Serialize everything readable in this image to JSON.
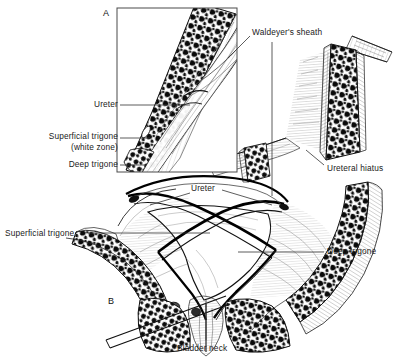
{
  "figure": {
    "style": "pen-and-ink anatomical line drawing, black and white",
    "panels": [
      {
        "id": "A",
        "mark": "A",
        "caption": "Longitudinal section of intramural ureter (inset box)"
      },
      {
        "id": "B",
        "mark": "B",
        "caption": "Interior view of bladder base and trigone"
      }
    ]
  },
  "labels": {
    "waldeyers_sheath": "Waldeyer's sheath",
    "ureter_a": "Ureter",
    "superficial_trigone": "Superficial trigone",
    "white_zone": "(white zone)",
    "deep_trigone_a": "Deep trigone",
    "ureteral_hiatus": "Ureteral hiatus",
    "ureter_b": "Ureter",
    "superficial_trigone_b": "Superficial trigone",
    "deep_trigone_b": "Deep trigone",
    "bladder_neck": "Bladder neck",
    "panel_a": "A",
    "panel_b": "B"
  },
  "colors": {
    "ink": "#000000",
    "paper": "#ffffff",
    "label_text": "#1a1a1a",
    "leader_line": "#333333",
    "inset_border": "#4a4a4a",
    "muscle_dark": "#0d0d0d",
    "hatch_mid": "#5a5a5a",
    "hatch_light": "#9a9a9a"
  },
  "inset_box": {
    "x": 117,
    "y": 8,
    "width": 120,
    "height": 164
  }
}
